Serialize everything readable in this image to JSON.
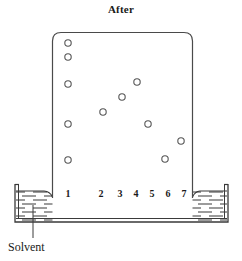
{
  "figure": {
    "title": "After",
    "width": 242,
    "height": 261,
    "background_color": "#ffffff",
    "line_color": "#3a3a3a",
    "spot_stroke_color": "#555555"
  },
  "plate": {
    "name": "tlc-plate",
    "left": 52,
    "top": 32,
    "right": 193,
    "bottom": 198,
    "corner_radius": 9,
    "fill": "#ffffff",
    "stroke": "#4a4a4a"
  },
  "trough": {
    "name": "solvent-trough",
    "outer_left": 15,
    "outer_right": 228,
    "rim_top": 184,
    "bottom": 222,
    "liquid_top": 191,
    "wall_stroke": "#3a3a3a",
    "hatch_color": "#4a4a4a"
  },
  "lanes": [
    {
      "number": "1",
      "x": 68
    },
    {
      "number": "2",
      "x": 101
    },
    {
      "number": "3",
      "x": 120
    },
    {
      "number": "4",
      "x": 136
    },
    {
      "number": "5",
      "x": 152
    },
    {
      "number": "6",
      "x": 168
    },
    {
      "number": "7",
      "x": 184
    }
  ],
  "lane_label_y": 188,
  "chart_data": {
    "type": "scatter",
    "title": "After",
    "xlabel": "Lane",
    "ylabel": "Migration distance",
    "categories": [
      "1",
      "2",
      "3",
      "4",
      "5",
      "6",
      "7"
    ],
    "grid": false,
    "legend": null,
    "xlim": [
      52,
      193
    ],
    "ylim": [
      32,
      198
    ],
    "series": [
      {
        "name": "lane-1-reference-mixture",
        "lane": "1",
        "points": [
          {
            "cx": 68,
            "cy": 43,
            "r": 3.2
          },
          {
            "cx": 68,
            "cy": 57,
            "r": 3.2
          },
          {
            "cx": 68,
            "cy": 84,
            "r": 3.2
          },
          {
            "cx": 68,
            "cy": 124,
            "r": 3.2
          },
          {
            "cx": 68,
            "cy": 160,
            "r": 3.2
          }
        ]
      },
      {
        "name": "lane-2-sample",
        "lane": "2",
        "points": [
          {
            "cx": 103,
            "cy": 112,
            "r": 3.2
          }
        ]
      },
      {
        "name": "lane-3-sample",
        "lane": "3",
        "points": [
          {
            "cx": 122,
            "cy": 97,
            "r": 3.2
          }
        ]
      },
      {
        "name": "lane-4-sample",
        "lane": "4",
        "points": [
          {
            "cx": 137,
            "cy": 82,
            "r": 3.2
          }
        ]
      },
      {
        "name": "lane-5-sample",
        "lane": "5",
        "points": [
          {
            "cx": 148,
            "cy": 124,
            "r": 3.2
          }
        ]
      },
      {
        "name": "lane-6-sample",
        "lane": "6",
        "points": [
          {
            "cx": 165,
            "cy": 159,
            "r": 3.2
          }
        ]
      },
      {
        "name": "lane-7-sample",
        "lane": "7",
        "points": [
          {
            "cx": 181,
            "cy": 141,
            "r": 3.2
          }
        ]
      }
    ]
  },
  "annotation": {
    "solvent_label": "Solvent",
    "leader_x": 33,
    "leader_top": 205,
    "leader_bottom": 238
  }
}
